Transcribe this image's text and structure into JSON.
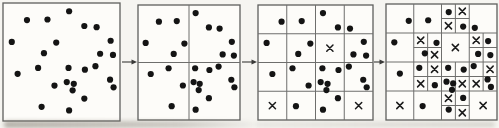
{
  "figure": {
    "kind": "grid-refinement-scatter-diagram",
    "canvas": {
      "width": 499,
      "height": 128
    },
    "colors": {
      "background": "#f6f5f1",
      "panel_background": "#fdfcf9",
      "panel_border": "#5f5f5d",
      "grid_line": "#6e6e6c",
      "dot": "#141414",
      "empty_cell_mark": "#1b1b1b",
      "arrow": "#3a3a38"
    },
    "dot_radius": 3.1,
    "x_mark_half_size": 3.1,
    "points_normalized": [
      [
        0.205,
        0.145
      ],
      [
        0.38,
        0.14
      ],
      [
        0.075,
        0.33
      ],
      [
        0.455,
        0.335
      ],
      [
        0.35,
        0.425
      ],
      [
        0.565,
        0.07
      ],
      [
        0.695,
        0.195
      ],
      [
        0.8,
        0.205
      ],
      [
        0.92,
        0.32
      ],
      [
        0.83,
        0.43
      ],
      [
        0.94,
        0.44
      ],
      [
        0.125,
        0.6
      ],
      [
        0.3,
        0.55
      ],
      [
        0.44,
        0.7
      ],
      [
        0.33,
        0.88
      ],
      [
        0.56,
        0.55
      ],
      [
        0.7,
        0.565
      ],
      [
        0.79,
        0.535
      ],
      [
        0.545,
        0.67
      ],
      [
        0.605,
        0.685
      ],
      [
        0.595,
        0.74
      ],
      [
        0.915,
        0.65
      ],
      [
        0.945,
        0.715
      ],
      [
        0.695,
        0.81
      ],
      [
        0.565,
        0.91
      ]
    ],
    "panels": [
      {
        "label": "level-0-no-partition",
        "left": 3,
        "top": 3,
        "width": 117,
        "height": 118,
        "v_lines": [],
        "h_lines": [],
        "x_marks": []
      },
      {
        "label": "level-1-2x2-grid",
        "left": 138,
        "top": 5,
        "width": 102,
        "height": 115,
        "v_lines": [
          {
            "x": 0.5,
            "y0": 0,
            "y1": 1
          }
        ],
        "h_lines": [
          {
            "y": 0.5,
            "x0": 0,
            "x1": 1
          }
        ],
        "x_marks": []
      },
      {
        "label": "level-2-4x4-grid",
        "left": 258,
        "top": 5,
        "width": 115,
        "height": 115,
        "v_lines": [
          {
            "x": 0.25,
            "y0": 0,
            "y1": 1
          },
          {
            "x": 0.5,
            "y0": 0,
            "y1": 1
          },
          {
            "x": 0.75,
            "y0": 0,
            "y1": 1
          }
        ],
        "h_lines": [
          {
            "y": 0.25,
            "x0": 0,
            "x1": 1
          },
          {
            "y": 0.5,
            "x0": 0,
            "x1": 1
          },
          {
            "y": 0.75,
            "x0": 0,
            "x1": 1
          }
        ],
        "x_marks": [
          [
            0.625,
            0.375
          ],
          [
            0.125,
            0.875
          ],
          [
            0.875,
            0.875
          ]
        ]
      },
      {
        "label": "level-3-quadtree-refined",
        "left": 386,
        "top": 4,
        "width": 111,
        "height": 116,
        "v_lines": [
          {
            "x": 0.25,
            "y0": 0,
            "y1": 1
          },
          {
            "x": 0.5,
            "y0": 0,
            "y1": 1
          },
          {
            "x": 0.75,
            "y0": 0,
            "y1": 1
          },
          {
            "x": 0.625,
            "y0": 0,
            "y1": 0.25
          },
          {
            "x": 0.375,
            "y0": 0.25,
            "y1": 0.5
          },
          {
            "x": 0.875,
            "y0": 0.25,
            "y1": 0.5
          },
          {
            "x": 0.375,
            "y0": 0.5,
            "y1": 0.75
          },
          {
            "x": 0.625,
            "y0": 0.5,
            "y1": 0.75
          },
          {
            "x": 0.875,
            "y0": 0.5,
            "y1": 0.75
          },
          {
            "x": 0.625,
            "y0": 0.75,
            "y1": 1
          }
        ],
        "h_lines": [
          {
            "y": 0.25,
            "x0": 0,
            "x1": 1
          },
          {
            "y": 0.5,
            "x0": 0,
            "x1": 1
          },
          {
            "y": 0.75,
            "x0": 0,
            "x1": 1
          },
          {
            "y": 0.125,
            "x0": 0.5,
            "x1": 0.75
          },
          {
            "y": 0.375,
            "x0": 0.25,
            "x1": 0.5
          },
          {
            "y": 0.375,
            "x0": 0.75,
            "x1": 1
          },
          {
            "y": 0.625,
            "x0": 0.25,
            "x1": 0.5
          },
          {
            "y": 0.625,
            "x0": 0.5,
            "x1": 0.75
          },
          {
            "y": 0.625,
            "x0": 0.75,
            "x1": 1
          },
          {
            "y": 0.875,
            "x0": 0.5,
            "x1": 0.75
          }
        ],
        "x_marks": [
          [
            0.625,
            0.375
          ],
          [
            0.125,
            0.875
          ],
          [
            0.875,
            0.875
          ],
          [
            0.6875,
            0.0625
          ],
          [
            0.5625,
            0.1875
          ],
          [
            0.3125,
            0.3125
          ],
          [
            0.4375,
            0.4375
          ],
          [
            0.8125,
            0.3125
          ],
          [
            0.4375,
            0.5625
          ],
          [
            0.3125,
            0.6875
          ],
          [
            0.6875,
            0.6875
          ],
          [
            0.9375,
            0.5625
          ],
          [
            0.8125,
            0.6875
          ],
          [
            0.5625,
            0.8125
          ],
          [
            0.6875,
            0.9375
          ]
        ]
      }
    ],
    "arrows": [
      {
        "x0": 122,
        "x1": 137,
        "y": 62
      },
      {
        "x0": 242,
        "x1": 257,
        "y": 62
      },
      {
        "x0": 374,
        "x1": 385,
        "y": 62
      }
    ]
  }
}
